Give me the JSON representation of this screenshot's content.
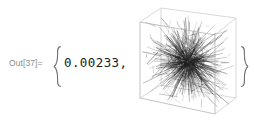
{
  "cell": {
    "kind": "output-cell",
    "label": "Out[37]=",
    "background_color": "#ffffff",
    "label_color": "#8c8c8c"
  },
  "expression": {
    "open_brace": "{",
    "close_brace": "}",
    "value_text": "0.00233,",
    "value": 0.00233,
    "value_color": "#1b1b1b",
    "brace_color": "#6f6f6f"
  },
  "graphic": {
    "name": "graphics3d-line-tangle",
    "type": "3d-line-plot",
    "box_color": "#c9c9c9",
    "line_color": "#1a1a1a",
    "has_bounding_box": true,
    "has_axes_labels": false,
    "description": "dense tangle of dark line segments inside a light gray wireframe cube",
    "segment_count": 900,
    "cube_projection": {
      "front_bottom_left": [
        9,
        96
      ],
      "front_bottom_right": [
        84,
        112
      ],
      "front_top_right": [
        84,
        33
      ],
      "front_top_left": [
        9,
        20
      ],
      "back_bottom_left": [
        30,
        83
      ],
      "back_bottom_right": [
        105,
        96
      ],
      "back_top_right": [
        105,
        16
      ],
      "back_top_left": [
        30,
        6
      ]
    }
  }
}
